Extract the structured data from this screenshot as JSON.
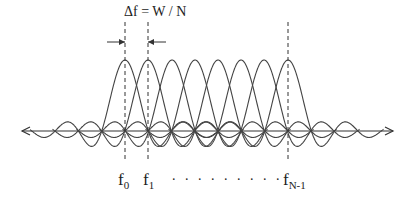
{
  "diagram": {
    "title_equation": "Δf = W / N",
    "labels": {
      "f0": {
        "base": "f",
        "sub": "0"
      },
      "f1": {
        "base": "f",
        "sub": "1"
      },
      "ellipsis": ". . . . . . . . .",
      "fN1": {
        "base": "f",
        "sub": "N-1"
      }
    },
    "subcarriers": {
      "count": 8,
      "centers_x": [
        125,
        148,
        172,
        195,
        218,
        241,
        264,
        288
      ],
      "peak_y": 60,
      "axis_y": 131
    },
    "colors": {
      "stroke": "#444444",
      "text": "#222222"
    }
  }
}
